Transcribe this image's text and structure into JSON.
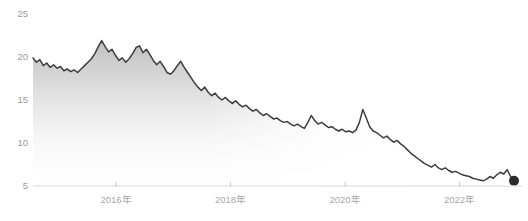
{
  "chart_data": {
    "type": "area",
    "title": "",
    "subtitle": "",
    "xlabel": "",
    "ylabel": "",
    "grid": false,
    "legend": null,
    "line_color": "#3c3c3c",
    "fill_color": "#b9b9b9",
    "marker_color": "#2b2b2b",
    "axis_color": "#d8d8d8",
    "tick_label_color": "#a0a0a0",
    "ylim": [
      3.2,
      26.8
    ],
    "yticks": [
      25,
      20,
      15,
      10,
      5
    ],
    "ytick_labels": [
      "25",
      "20",
      "15",
      "10",
      "5"
    ],
    "xlim": [
      "2014.55",
      "2022.95"
    ],
    "xticks": [
      2016,
      2018,
      2020,
      2022
    ],
    "xtick_labels": [
      "2016年",
      "2018年",
      "2020年",
      "2022年"
    ],
    "end_marker_value": 5.6,
    "series": [
      {
        "name": "value",
        "x": [
          2014.55,
          2014.61,
          2014.67,
          2014.73,
          2014.79,
          2014.85,
          2014.91,
          2014.97,
          2015.03,
          2015.09,
          2015.15,
          2015.21,
          2015.27,
          2015.33,
          2015.39,
          2015.45,
          2015.51,
          2015.57,
          2015.63,
          2015.69,
          2015.75,
          2015.81,
          2015.87,
          2015.93,
          2015.99,
          2016.05,
          2016.11,
          2016.17,
          2016.23,
          2016.29,
          2016.35,
          2016.41,
          2016.47,
          2016.53,
          2016.59,
          2016.65,
          2016.71,
          2016.77,
          2016.83,
          2016.89,
          2016.95,
          2017.01,
          2017.07,
          2017.13,
          2017.19,
          2017.25,
          2017.31,
          2017.37,
          2017.43,
          2017.49,
          2017.55,
          2017.61,
          2017.67,
          2017.73,
          2017.79,
          2017.85,
          2017.91,
          2017.97,
          2018.03,
          2018.09,
          2018.15,
          2018.21,
          2018.27,
          2018.33,
          2018.39,
          2018.45,
          2018.51,
          2018.57,
          2018.63,
          2018.69,
          2018.75,
          2018.81,
          2018.87,
          2018.93,
          2018.99,
          2019.05,
          2019.11,
          2019.17,
          2019.23,
          2019.29,
          2019.35,
          2019.41,
          2019.47,
          2019.53,
          2019.59,
          2019.65,
          2019.71,
          2019.77,
          2019.83,
          2019.89,
          2019.95,
          2020.01,
          2020.07,
          2020.13,
          2020.19,
          2020.25,
          2020.31,
          2020.37,
          2020.43,
          2020.49,
          2020.55,
          2020.61,
          2020.67,
          2020.73,
          2020.79,
          2020.85,
          2020.91,
          2020.97,
          2021.03,
          2021.09,
          2021.15,
          2021.21,
          2021.27,
          2021.33,
          2021.39,
          2021.45,
          2021.51,
          2021.57,
          2021.63,
          2021.69,
          2021.75,
          2021.81,
          2021.87,
          2021.93,
          2021.99,
          2022.05,
          2022.11,
          2022.17,
          2022.23,
          2022.29,
          2022.35,
          2022.41,
          2022.47,
          2022.53,
          2022.59,
          2022.65,
          2022.71,
          2022.77,
          2022.83,
          2022.89,
          2022.95
        ],
        "values": [
          19.9,
          19.4,
          19.7,
          19.0,
          19.3,
          18.8,
          19.1,
          18.7,
          18.9,
          18.4,
          18.6,
          18.3,
          18.5,
          18.2,
          18.6,
          19.0,
          19.4,
          19.8,
          20.4,
          21.2,
          21.9,
          21.2,
          20.6,
          20.9,
          20.2,
          19.6,
          19.9,
          19.4,
          19.8,
          20.4,
          21.1,
          21.3,
          20.5,
          20.9,
          20.3,
          19.6,
          19.1,
          19.5,
          18.9,
          18.2,
          18.0,
          18.4,
          19.0,
          19.5,
          18.8,
          18.2,
          17.6,
          17.0,
          16.5,
          16.1,
          16.5,
          15.9,
          15.5,
          15.8,
          15.3,
          15.0,
          15.3,
          14.9,
          14.6,
          14.9,
          14.5,
          14.2,
          14.4,
          14.0,
          13.7,
          13.9,
          13.5,
          13.2,
          13.4,
          13.1,
          12.8,
          12.9,
          12.6,
          12.4,
          12.5,
          12.2,
          12.0,
          12.2,
          11.9,
          11.7,
          12.4,
          13.2,
          12.6,
          12.2,
          12.4,
          12.1,
          11.8,
          11.9,
          11.6,
          11.4,
          11.6,
          11.3,
          11.4,
          11.2,
          11.5,
          12.4,
          13.9,
          12.9,
          11.9,
          11.4,
          11.2,
          10.9,
          10.6,
          10.8,
          10.4,
          10.1,
          10.3,
          9.9,
          9.6,
          9.2,
          8.8,
          8.5,
          8.2,
          7.9,
          7.6,
          7.4,
          7.2,
          7.5,
          7.1,
          6.9,
          7.1,
          6.8,
          6.6,
          6.7,
          6.5,
          6.3,
          6.2,
          6.1,
          5.9,
          5.8,
          5.7,
          5.6,
          5.8,
          6.1,
          5.9,
          6.3,
          6.6,
          6.4,
          6.9,
          6.1,
          5.6
        ]
      }
    ]
  }
}
